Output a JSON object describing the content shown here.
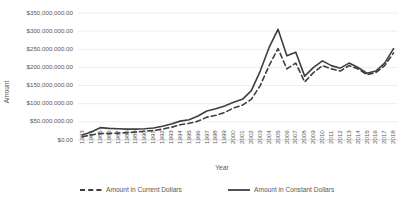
{
  "chart_data": {
    "type": "line",
    "title": "",
    "xlabel": "Year",
    "ylabel": "Amount",
    "grid": true,
    "legend_position": "bottom",
    "ylim": [
      0,
      350000000
    ],
    "ytick_step": 50000000,
    "ytick_labels": [
      "$0.00",
      "$50,000,000.00",
      "$100,000,000.00",
      "$150,000,000.00",
      "$200,000,000.00",
      "$250,000,000.00",
      "$300,000,000.00",
      "$350,000,000.00"
    ],
    "ytick_values": [
      0,
      50000000,
      100000000,
      150000000,
      200000000,
      250000000,
      300000000,
      350000000
    ],
    "categories": [
      "1983",
      "1984",
      "1985",
      "1986",
      "1987",
      "1988",
      "1989",
      "1990",
      "1991",
      "1992",
      "1993",
      "1994",
      "1995",
      "1996",
      "1997",
      "1998",
      "1999",
      "2000",
      "2001",
      "2002",
      "2003",
      "2004",
      "2005",
      "2006",
      "2007",
      "2008",
      "2009",
      "2010",
      "2011",
      "2012",
      "2013",
      "2014",
      "2015",
      "2016",
      "2017",
      "2018"
    ],
    "series": [
      {
        "name": "Amount in Current Dollars",
        "style": "dashed",
        "color": "#3f3f3f",
        "values": [
          9000000,
          14000000,
          18000000,
          18000000,
          19000000,
          20000000,
          22000000,
          24000000,
          26000000,
          30000000,
          35000000,
          42000000,
          46000000,
          52000000,
          63000000,
          68000000,
          76000000,
          88000000,
          96000000,
          112000000,
          150000000,
          205000000,
          252000000,
          196000000,
          212000000,
          160000000,
          186000000,
          205000000,
          196000000,
          190000000,
          205000000,
          196000000,
          180000000,
          186000000,
          205000000,
          240000000
        ]
      },
      {
        "name": "Amount in Constant Dollars",
        "style": "solid",
        "color": "#3f3f3f",
        "values": [
          14000000,
          22000000,
          34000000,
          32000000,
          31000000,
          30000000,
          30000000,
          31000000,
          33000000,
          38000000,
          44000000,
          52000000,
          56000000,
          66000000,
          80000000,
          86000000,
          94000000,
          104000000,
          112000000,
          136000000,
          190000000,
          255000000,
          305000000,
          232000000,
          242000000,
          176000000,
          200000000,
          218000000,
          205000000,
          198000000,
          212000000,
          200000000,
          184000000,
          190000000,
          212000000,
          252000000
        ]
      }
    ]
  },
  "legend": {
    "items": [
      {
        "label": "Amount in Current Dollars",
        "style": "dashed"
      },
      {
        "label": "Amount in Constant Dollars",
        "style": "solid"
      }
    ]
  }
}
